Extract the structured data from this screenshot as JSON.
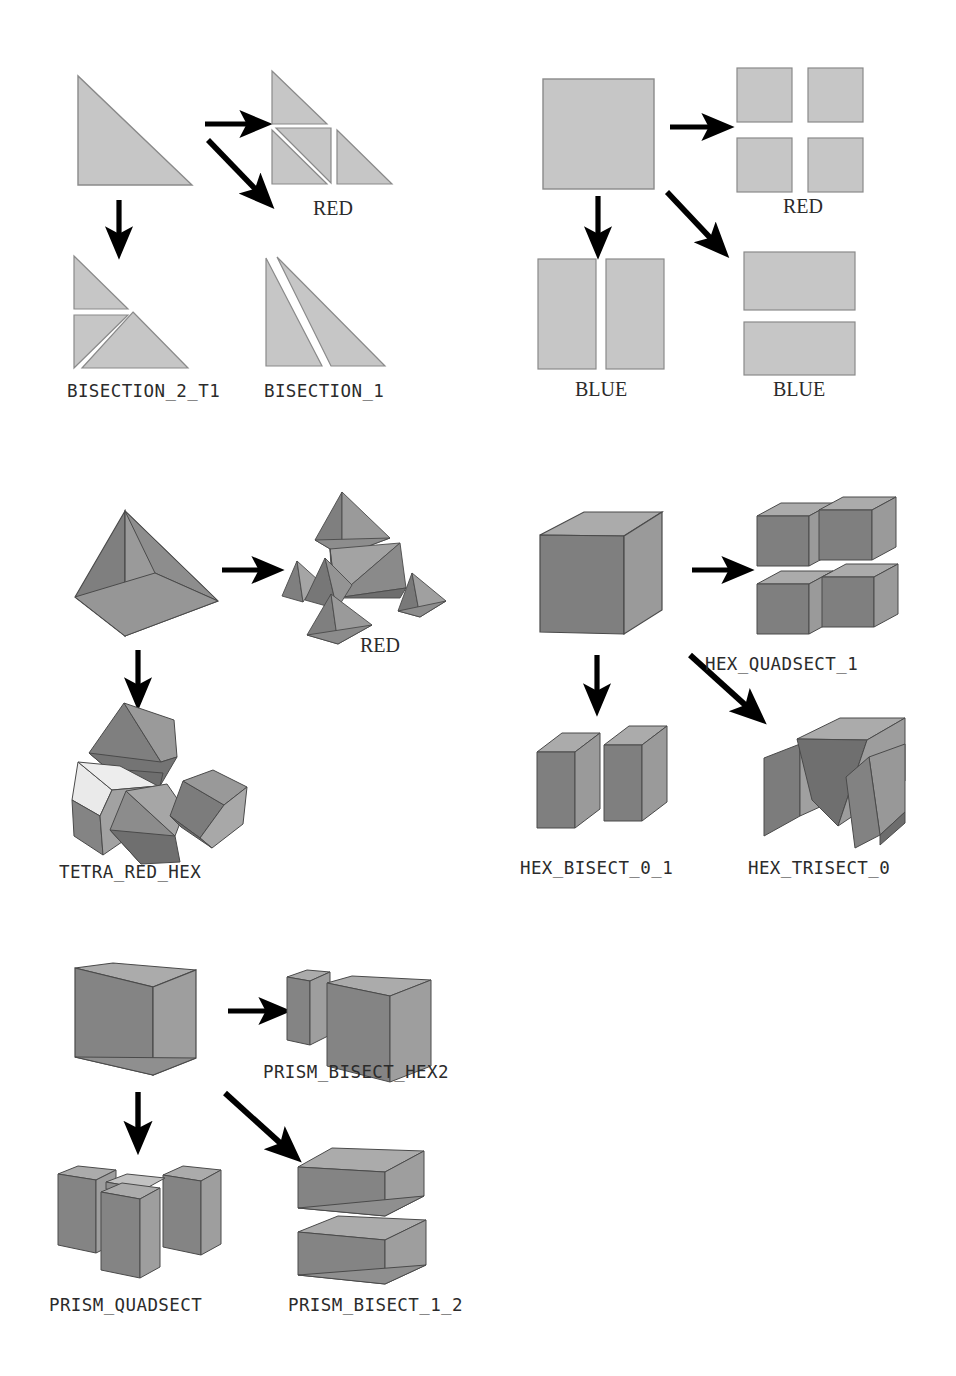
{
  "figure": {
    "background_color": "#ffffff",
    "palette": {
      "shape_2d_fill": "#c6c6c6",
      "shape_2d_stroke": "#8a8a8a",
      "face_top": "#ababab",
      "face_right": "#9a9a9a",
      "face_left": "#7f7f7f",
      "face_highlight": "#e9e9e9",
      "face_dark": "#6e6e6e",
      "edge_stroke": "#4a4a4a",
      "arrow_color": "#000000",
      "text_color": "#2b2b2b"
    }
  },
  "groups": [
    {
      "id": "triangle",
      "name": "triangle-subdivision-group",
      "source_shape": "right-triangle",
      "arrows": [
        "right",
        "down",
        "diagonal"
      ],
      "results": [
        {
          "id": "tri-red",
          "label": "RED",
          "label_style": "serif",
          "pieces": 4
        },
        {
          "id": "tri-bisection-2-t1",
          "label": "BISECTION_2_T1",
          "label_style": "mono",
          "pieces": 3
        },
        {
          "id": "tri-bisection-1",
          "label": "BISECTION_1",
          "label_style": "mono",
          "pieces": 2
        }
      ]
    },
    {
      "id": "quad",
      "name": "quad-subdivision-group",
      "source_shape": "square",
      "arrows": [
        "right",
        "down",
        "diagonal"
      ],
      "results": [
        {
          "id": "quad-red",
          "label": "RED",
          "label_style": "serif",
          "pieces": 4
        },
        {
          "id": "quad-blue-vertical",
          "label": "BLUE",
          "label_style": "serif",
          "pieces": 2
        },
        {
          "id": "quad-blue-horizontal",
          "label": "BLUE",
          "label_style": "serif",
          "pieces": 2
        }
      ]
    },
    {
      "id": "tetra",
      "name": "tetrahedron-subdivision-group",
      "source_shape": "tetrahedron",
      "arrows": [
        "right",
        "down"
      ],
      "results": [
        {
          "id": "tetra-red",
          "label": "RED",
          "label_style": "serif",
          "pieces": 8
        },
        {
          "id": "tetra-red-hex",
          "label": "TETRA_RED_HEX",
          "label_style": "mono",
          "pieces": 4
        }
      ]
    },
    {
      "id": "hex",
      "name": "hexahedron-subdivision-group",
      "source_shape": "hexahedron",
      "arrows": [
        "right",
        "down",
        "diagonal"
      ],
      "results": [
        {
          "id": "hex-quadsect-1",
          "label": "HEX_QUADSECT_1",
          "label_style": "mono",
          "pieces": 4
        },
        {
          "id": "hex-bisect-0-1",
          "label": "HEX_BISECT_0_1",
          "label_style": "mono",
          "pieces": 2
        },
        {
          "id": "hex-trisect-0",
          "label": "HEX_TRISECT_0",
          "label_style": "mono",
          "pieces": 3
        }
      ]
    },
    {
      "id": "prism",
      "name": "prism-subdivision-group",
      "source_shape": "triangular-prism",
      "arrows": [
        "right",
        "down",
        "diagonal"
      ],
      "results": [
        {
          "id": "prism-bisect-hex2",
          "label": "PRISM_BISECT_HEX2",
          "label_style": "mono",
          "pieces": 2
        },
        {
          "id": "prism-quadsect",
          "label": "PRISM_QUADSECT",
          "label_style": "mono",
          "pieces": 4
        },
        {
          "id": "prism-bisect-1-2",
          "label": "PRISM_BISECT_1_2",
          "label_style": "mono",
          "pieces": 2
        }
      ]
    }
  ],
  "labels": {
    "tri_red": "RED",
    "tri_bisection_2_t1": "BISECTION_2_T1",
    "tri_bisection_1": "BISECTION_1",
    "quad_red": "RED",
    "quad_blue_left": "BLUE",
    "quad_blue_right": "BLUE",
    "tetra_red": "RED",
    "tetra_red_hex": "TETRA_RED_HEX",
    "hex_quadsect_1": "HEX_QUADSECT_1",
    "hex_bisect_0_1": "HEX_BISECT_0_1",
    "hex_trisect_0": "HEX_TRISECT_0",
    "prism_bisect_hex2": "PRISM_BISECT_HEX2",
    "prism_quadsect": "PRISM_QUADSECT",
    "prism_bisect_1_2": "PRISM_BISECT_1_2"
  }
}
